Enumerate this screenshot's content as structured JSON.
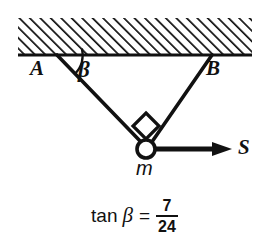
{
  "figure": {
    "type": "physics-free-body-diagram",
    "width": 269,
    "height": 245,
    "background_color": "#ffffff",
    "ink_color": "#111111"
  },
  "ceiling": {
    "label": "hatched-ceiling",
    "hatch_direction": "backslash",
    "hatch_angle_deg": -45,
    "hatch_spacing_px": 7.4,
    "hatch_stroke_width": 3.4,
    "band": {
      "x": 18,
      "y": 18,
      "width": 234,
      "height": 37
    },
    "baseline_y": 55,
    "baseline_stroke_width": 3.2
  },
  "anchors": {
    "A": {
      "label": "A",
      "x": 57,
      "y": 55
    },
    "B": {
      "label": "B",
      "x": 212,
      "y": 55
    }
  },
  "knot": {
    "label": "m",
    "x": 146,
    "y": 149,
    "radius": 9,
    "stroke_width": 3.6,
    "fill": "#ffffff"
  },
  "cables": [
    {
      "name": "cable-A",
      "from": "A",
      "x1": 57,
      "y1": 55,
      "x2": 141,
      "y2": 142,
      "stroke_width": 3.6
    },
    {
      "name": "cable-B",
      "from": "B",
      "x1": 212,
      "y1": 55,
      "x2": 152,
      "y2": 142,
      "stroke_width": 3.6
    }
  ],
  "angle": {
    "label": "β",
    "vertex": "A",
    "arc_radius": 26,
    "between": [
      "ceiling-line",
      "cable-A"
    ]
  },
  "right_angle_marker": {
    "name": "right-angle-square",
    "shape": "diamond",
    "cx": 146,
    "cy": 126,
    "half_diagonal": 13,
    "stroke_width": 3.2
  },
  "force": {
    "label": "S",
    "direction": "right",
    "x1": 155,
    "y1": 149,
    "x2": 232,
    "y2": 149,
    "stroke_width": 5,
    "arrowhead_length": 16,
    "arrowhead_half_width": 7
  },
  "equation": {
    "function": "tan",
    "variable": "β",
    "equals": "=",
    "numerator": "7",
    "denominator": "24",
    "full_text": "tan β = 7/24"
  }
}
